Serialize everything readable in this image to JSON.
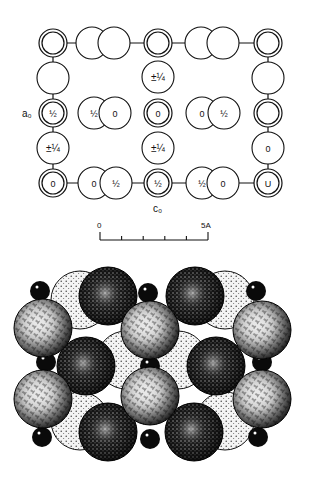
{
  "figure": {
    "type": "crystal-structure-diagram",
    "schematic": {
      "axis_labels": {
        "a": "a₀",
        "c": "c₀"
      },
      "scale_bar": {
        "start_label": "0",
        "end_label": "5A",
        "ticks": 6
      },
      "atoms": [
        {
          "id": "r1c1",
          "kind": "double",
          "x": 53,
          "y": 43,
          "label": ""
        },
        {
          "id": "r1c2a",
          "kind": "single",
          "x": 92,
          "y": 43,
          "label": ""
        },
        {
          "id": "r1c2b",
          "kind": "single",
          "x": 114,
          "y": 43,
          "label": ""
        },
        {
          "id": "r1c3",
          "kind": "double",
          "x": 158,
          "y": 43,
          "label": ""
        },
        {
          "id": "r1c4a",
          "kind": "single",
          "x": 201,
          "y": 43,
          "label": ""
        },
        {
          "id": "r1c4b",
          "kind": "single",
          "x": 223,
          "y": 43,
          "label": ""
        },
        {
          "id": "r1c5",
          "kind": "double",
          "x": 268,
          "y": 43,
          "label": ""
        },
        {
          "id": "r2c1",
          "kind": "single",
          "x": 53,
          "y": 78,
          "label": ""
        },
        {
          "id": "r2c3",
          "kind": "single",
          "x": 158,
          "y": 77,
          "label": "±¼"
        },
        {
          "id": "r2c5",
          "kind": "single",
          "x": 268,
          "y": 78,
          "label": ""
        },
        {
          "id": "r3c1",
          "kind": "double",
          "x": 53,
          "y": 113,
          "label": "½"
        },
        {
          "id": "r3c2a",
          "kind": "single",
          "x": 94,
          "y": 113,
          "label": "½"
        },
        {
          "id": "r3c2b",
          "kind": "single",
          "x": 115,
          "y": 113,
          "label": "0"
        },
        {
          "id": "r3c3",
          "kind": "double",
          "x": 158,
          "y": 113,
          "label": "0"
        },
        {
          "id": "r3c4a",
          "kind": "single",
          "x": 202,
          "y": 113,
          "label": "0"
        },
        {
          "id": "r3c4b",
          "kind": "single",
          "x": 224,
          "y": 113,
          "label": "½"
        },
        {
          "id": "r3c5",
          "kind": "double",
          "x": 268,
          "y": 113,
          "label": ""
        },
        {
          "id": "r4c1",
          "kind": "single",
          "x": 53,
          "y": 148,
          "label": "±¼"
        },
        {
          "id": "r4c3",
          "kind": "single",
          "x": 158,
          "y": 148,
          "label": "±¼"
        },
        {
          "id": "r4c5",
          "kind": "single",
          "x": 268,
          "y": 148,
          "label": "0"
        },
        {
          "id": "r5c1",
          "kind": "double",
          "x": 53,
          "y": 183,
          "label": "0"
        },
        {
          "id": "r5c2a",
          "kind": "single",
          "x": 94,
          "y": 183,
          "label": "0"
        },
        {
          "id": "r5c2b",
          "kind": "single",
          "x": 116,
          "y": 183,
          "label": "½"
        },
        {
          "id": "r5c3",
          "kind": "double",
          "x": 158,
          "y": 183,
          "label": "½"
        },
        {
          "id": "r5c4a",
          "kind": "single",
          "x": 202,
          "y": 183,
          "label": "½"
        },
        {
          "id": "r5c4b",
          "kind": "single",
          "x": 223,
          "y": 183,
          "label": "0"
        },
        {
          "id": "r5c5",
          "kind": "double",
          "x": 268,
          "y": 183,
          "label": "U"
        }
      ]
    },
    "space_filling_model": {
      "light_spheres": [
        {
          "x": 80,
          "y": 300
        },
        {
          "x": 225,
          "y": 300
        },
        {
          "x": 126,
          "y": 360
        },
        {
          "x": 178,
          "y": 360
        },
        {
          "x": 80,
          "y": 421
        },
        {
          "x": 225,
          "y": 421
        }
      ],
      "dark_spheres": [
        {
          "x": 108,
          "y": 296
        },
        {
          "x": 195,
          "y": 296
        },
        {
          "x": 86,
          "y": 366
        },
        {
          "x": 216,
          "y": 366
        },
        {
          "x": 108,
          "y": 432
        },
        {
          "x": 194,
          "y": 432
        }
      ],
      "hatched_spheres": [
        {
          "x": 43,
          "y": 328
        },
        {
          "x": 150,
          "y": 330
        },
        {
          "x": 262,
          "y": 330
        },
        {
          "x": 43,
          "y": 399
        },
        {
          "x": 150,
          "y": 396
        },
        {
          "x": 262,
          "y": 399
        }
      ],
      "small_black_atoms": [
        {
          "x": 40,
          "y": 291
        },
        {
          "x": 148,
          "y": 293
        },
        {
          "x": 256,
          "y": 291
        },
        {
          "x": 46,
          "y": 362
        },
        {
          "x": 150,
          "y": 366
        },
        {
          "x": 262,
          "y": 362
        },
        {
          "x": 42,
          "y": 437
        },
        {
          "x": 150,
          "y": 439
        },
        {
          "x": 258,
          "y": 437
        }
      ]
    }
  }
}
